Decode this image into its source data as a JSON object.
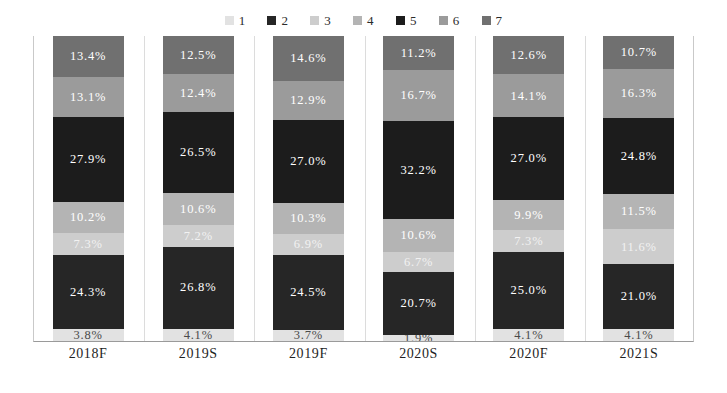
{
  "chart_data": {
    "type": "bar",
    "variant": "stacked-percent-vertical",
    "title": "",
    "subtitle": "",
    "xlabel": "",
    "ylabel": "",
    "ylim": [
      0,
      100
    ],
    "grid": false,
    "legend_position": "top-center",
    "categories": [
      "2018F",
      "2019S",
      "2019F",
      "2020S",
      "2020F",
      "2021S"
    ],
    "stack_order_bottom_to_top": [
      "1",
      "2",
      "3",
      "4",
      "5",
      "6",
      "7"
    ],
    "series": [
      {
        "name": "1",
        "color": "#e2e2e2",
        "label_color": "#4a4a4a",
        "values": [
          3.8,
          4.1,
          3.7,
          1.9,
          4.1,
          4.1
        ],
        "labels": [
          "3.8%",
          "4.1%",
          "3.7%",
          "1.9%",
          "4.1%",
          "4.1%"
        ]
      },
      {
        "name": "2",
        "color": "#262626",
        "label_color": "#ffffff",
        "values": [
          24.3,
          26.8,
          24.5,
          20.7,
          25.0,
          21.0
        ],
        "labels": [
          "24.3%",
          "26.8%",
          "24.5%",
          "20.7%",
          "25.0%",
          "21.0%"
        ]
      },
      {
        "name": "3",
        "color": "#cdcdcd",
        "label_color": "#f2f2f2",
        "values": [
          7.3,
          7.2,
          6.9,
          6.7,
          7.3,
          11.6
        ],
        "labels": [
          "7.3%",
          "7.2%",
          "6.9%",
          "6.7%",
          "7.3%",
          "11.6%"
        ]
      },
      {
        "name": "4",
        "color": "#b4b4b4",
        "label_color": "#ffffff",
        "values": [
          10.2,
          10.6,
          10.3,
          10.6,
          9.9,
          11.5
        ],
        "labels": [
          "10.2%",
          "10.6%",
          "10.3%",
          "10.6%",
          "9.9%",
          "11.5%"
        ]
      },
      {
        "name": "5",
        "color": "#1c1c1c",
        "label_color": "#ffffff",
        "values": [
          27.9,
          26.5,
          27.0,
          32.2,
          27.0,
          24.8
        ],
        "labels": [
          "27.9%",
          "26.5%",
          "27.0%",
          "32.2%",
          "27.0%",
          "24.8%"
        ]
      },
      {
        "name": "6",
        "color": "#9b9b9b",
        "label_color": "#ffffff",
        "values": [
          13.1,
          12.4,
          12.9,
          16.7,
          14.1,
          16.3
        ],
        "labels": [
          "13.1%",
          "12.4%",
          "12.9%",
          "16.7%",
          "14.1%",
          "16.3%"
        ]
      },
      {
        "name": "7",
        "color": "#707070",
        "label_color": "#ffffff",
        "values": [
          13.4,
          12.5,
          14.6,
          11.2,
          12.6,
          10.7
        ],
        "labels": [
          "13.4%",
          "12.5%",
          "14.6%",
          "11.2%",
          "12.6%",
          "10.7%"
        ]
      }
    ]
  },
  "legend": {
    "items": [
      {
        "label": "1",
        "color": "#e2e2e2"
      },
      {
        "label": "2",
        "color": "#262626"
      },
      {
        "label": "3",
        "color": "#cdcdcd"
      },
      {
        "label": "4",
        "color": "#b4b4b4"
      },
      {
        "label": "5",
        "color": "#1c1c1c"
      },
      {
        "label": "6",
        "color": "#9b9b9b"
      },
      {
        "label": "7",
        "color": "#707070"
      }
    ]
  },
  "axis": {
    "categories": [
      "2018F",
      "2019S",
      "2019F",
      "2020S",
      "2020F",
      "2021S"
    ]
  },
  "style": {
    "background": "#ffffff",
    "frame_color": "#c9c9c9",
    "gridline_color": "#dcdcdc",
    "baseline_color": "#9a9a9a"
  }
}
